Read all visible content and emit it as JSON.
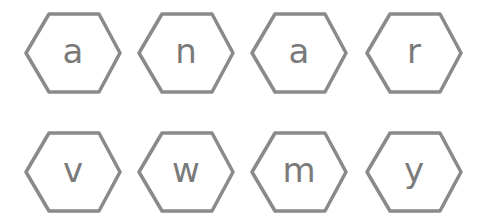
{
  "puzzle": {
    "stroke_color": "#8a8a8a",
    "letter_color": "#7a7a7a",
    "rows": [
      {
        "tiles": [
          {
            "letter": "a"
          },
          {
            "letter": "n"
          },
          {
            "letter": "a"
          },
          {
            "letter": "r"
          }
        ]
      },
      {
        "tiles": [
          {
            "letter": "v"
          },
          {
            "letter": "w"
          },
          {
            "letter": "m"
          },
          {
            "letter": "y"
          }
        ]
      }
    ]
  }
}
